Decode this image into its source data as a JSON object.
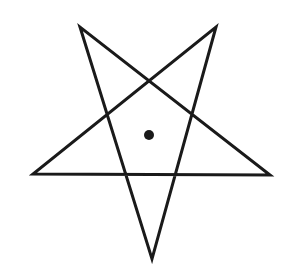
{
  "diagram": {
    "width": 295,
    "height": 280,
    "background": "#ffffff",
    "stroke_color": "#1a1a1a",
    "stroke_width": 3,
    "star": {
      "vertices": {
        "top_left": [
          80,
          27
        ],
        "top_right": [
          216,
          27
        ],
        "left": [
          33,
          174
        ],
        "right": [
          270,
          175
        ],
        "bottom": [
          152,
          259
        ]
      },
      "edge_order": [
        "top_left",
        "bottom",
        "top_right",
        "left",
        "right",
        "top_left"
      ]
    },
    "center_dot": {
      "cx": 149,
      "cy": 135,
      "r": 5,
      "fill": "#1a1a1a"
    }
  }
}
